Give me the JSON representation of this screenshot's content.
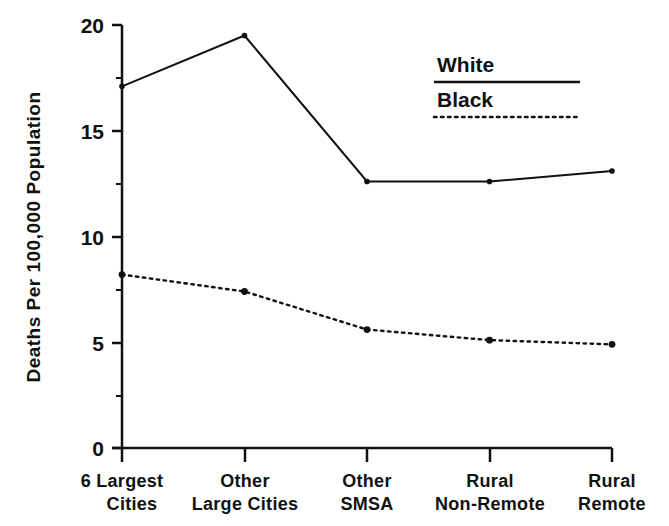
{
  "chart_data": {
    "type": "line",
    "title": "",
    "xlabel": "",
    "ylabel": "Deaths Per 100,000 Population",
    "categories": [
      "6 Largest\nCities",
      "Other\nLarge Cities",
      "Other\nSMSA",
      "Rural\nNon-Remote",
      "Rural\nRemote"
    ],
    "category_lines": [
      [
        "6 Largest",
        "Cities"
      ],
      [
        "Other",
        "Large Cities"
      ],
      [
        "Other",
        "SMSA"
      ],
      [
        "Rural",
        "Non-Remote"
      ],
      [
        "Rural",
        "Remote"
      ]
    ],
    "series": [
      {
        "name": "White",
        "style": "solid",
        "color": "#111111",
        "values": [
          17.1,
          19.5,
          12.6,
          12.6,
          13.1
        ]
      },
      {
        "name": "Black",
        "style": "dotted",
        "color": "#111111",
        "values": [
          8.2,
          7.4,
          5.6,
          5.1,
          4.9
        ]
      }
    ],
    "ylim": [
      0,
      20
    ],
    "yticks": [
      0,
      5,
      10,
      15,
      20
    ],
    "ytick_labels": [
      "0",
      "5",
      "10",
      "15",
      "20"
    ],
    "yminor_ticks": [
      2.5,
      7.5,
      12.5,
      17.5
    ],
    "grid": false,
    "legend_position": "upper-right"
  },
  "legend": {
    "entries": [
      {
        "label": "White",
        "style": "solid"
      },
      {
        "label": "Black",
        "style": "dotted"
      }
    ]
  },
  "axes": {
    "y_title": "Deaths Per 100,000 Population",
    "y_tick_0": "0",
    "y_tick_5": "5",
    "y_tick_10": "10",
    "y_tick_15": "15",
    "y_tick_20": "20"
  },
  "xlabels": {
    "c0l0": "6 Largest",
    "c0l1": "Cities",
    "c1l0": "Other",
    "c1l1": "Large Cities",
    "c2l0": "Other",
    "c2l1": "SMSA",
    "c3l0": "Rural",
    "c3l1": "Non-Remote",
    "c4l0": "Rural",
    "c4l1": "Remote"
  },
  "colors": {
    "ink": "#111111",
    "background": "#ffffff"
  }
}
